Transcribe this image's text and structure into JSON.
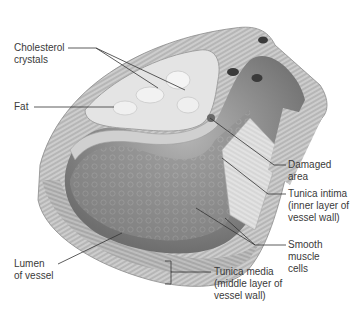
{
  "figure": {
    "labels": {
      "cholesterol": {
        "line1": "Cholesterol",
        "line2": "crystals"
      },
      "fat": {
        "line1": "Fat"
      },
      "damaged": {
        "line1": "Damaged",
        "line2": "area"
      },
      "intima": {
        "line1": "Tunica intima",
        "line2": "(inner layer of",
        "line3": "vessel wall)"
      },
      "smooth": {
        "line1": "Smooth",
        "line2": "muscle",
        "line3": "cells"
      },
      "lumen": {
        "line1": "Lumen",
        "line2": "of vessel"
      },
      "media": {
        "line1": "Tunica media",
        "line2": "(middle layer of",
        "line3": "vessel wall)"
      }
    },
    "colors": {
      "wall": "#b8b8b8",
      "wall_dark": "#7a7a7a",
      "lumen": "#8c8c8c",
      "plaque": "#dcdcdc",
      "text": "#3a3a3a",
      "leader": "#333333"
    }
  }
}
